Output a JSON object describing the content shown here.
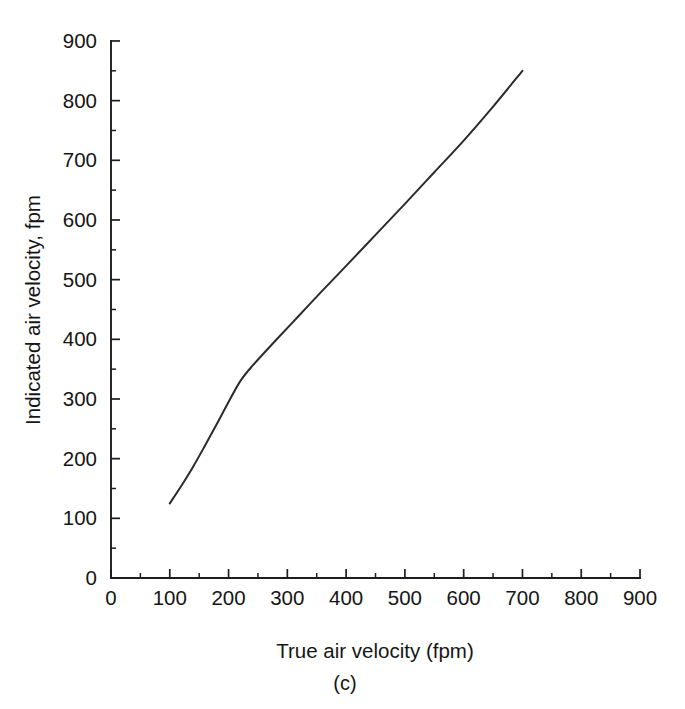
{
  "figure": {
    "caption": "(c)",
    "background_color": "#ffffff",
    "line_color": "#2b2b2b",
    "axis_color": "#1d1d1d",
    "text_color": "#161616"
  },
  "chart_data": {
    "type": "line",
    "title": "",
    "xlabel": "True air velocity (fpm)",
    "ylabel": "Indicated air velocity, fpm",
    "xlim": [
      0,
      900
    ],
    "ylim": [
      0,
      900
    ],
    "grid": false,
    "legend": "none",
    "x_ticks": [
      0,
      100,
      200,
      300,
      400,
      500,
      600,
      700,
      800,
      900
    ],
    "y_ticks": [
      0,
      100,
      200,
      300,
      400,
      500,
      600,
      700,
      800,
      900
    ],
    "x_tick_labels": [
      "0",
      "100",
      "200",
      "300",
      "400",
      "500",
      "600",
      "700",
      "800",
      "900"
    ],
    "y_tick_labels": [
      "0",
      "100",
      "200",
      "300",
      "400",
      "500",
      "600",
      "700",
      "800",
      "900"
    ],
    "x_minor_ticks": [
      50,
      150,
      250,
      350,
      450,
      550,
      650,
      750,
      850
    ],
    "y_minor_ticks": [
      50,
      150,
      250,
      350,
      450,
      550,
      650,
      750,
      850
    ],
    "series": [
      {
        "name": "Indicated air velocity",
        "x": [
          100,
          120,
          140,
          160,
          180,
          200,
          220,
          240,
          280,
          320,
          360,
          400,
          450,
          500,
          550,
          600,
          650,
          700
        ],
        "y": [
          125,
          155,
          187,
          222,
          258,
          295,
          330,
          355,
          398,
          440,
          482,
          523,
          575,
          627,
          680,
          733,
          790,
          850
        ]
      }
    ],
    "annotations": [
      {
        "text": "(c)",
        "role": "figure-caption"
      }
    ]
  },
  "geometry": {
    "origin_px": {
      "x": 111,
      "y": 578
    },
    "x_px_per_unit": 0.5878,
    "y_px_per_unit": 0.5967,
    "major_tick_len": 9,
    "minor_tick_len": 5
  }
}
